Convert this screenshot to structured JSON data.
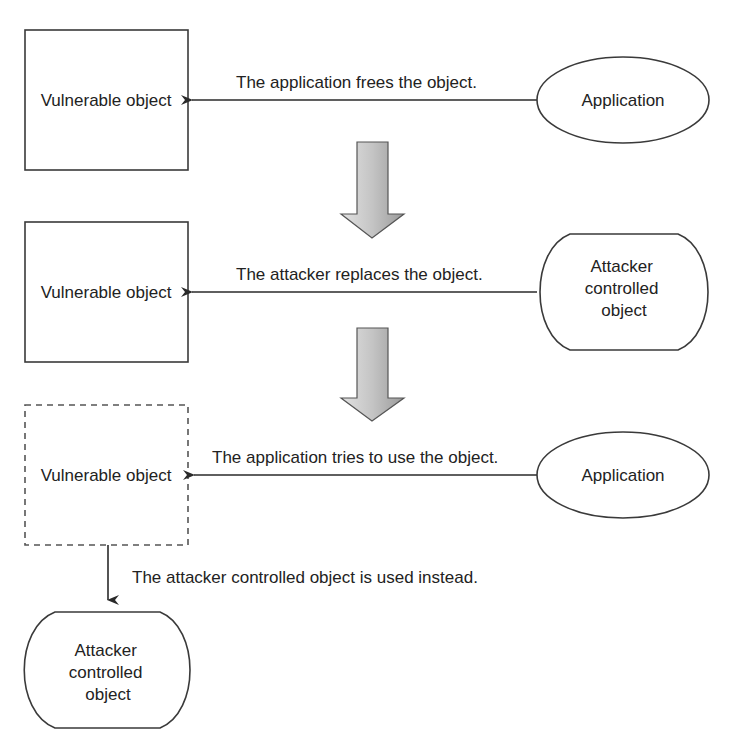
{
  "diagram": {
    "type": "flow",
    "title": "",
    "steps": [
      {
        "left_node": {
          "label": "Vulnerable object",
          "shape": "rectangle",
          "border": "solid"
        },
        "right_node": {
          "label": "Application",
          "shape": "ellipse"
        },
        "edge_label": "The application frees the object.",
        "edge_direction": "right-to-left"
      },
      {
        "left_node": {
          "label": "Vulnerable object",
          "shape": "rectangle",
          "border": "solid"
        },
        "right_node": {
          "label_lines": [
            "Attacker",
            "controlled",
            "object"
          ],
          "shape": "rounded-stadium"
        },
        "edge_label": "The attacker replaces the object.",
        "edge_direction": "right-to-left"
      },
      {
        "left_node": {
          "label": "Vulnerable object",
          "shape": "rectangle",
          "border": "dashed"
        },
        "right_node": {
          "label": "Application",
          "shape": "ellipse"
        },
        "edge_label": "The application tries to use the object.",
        "edge_direction": "right-to-left"
      }
    ],
    "final": {
      "edge_label": "The attacker controlled object is used instead.",
      "node": {
        "label_lines": [
          "Attacker",
          "controlled",
          "object"
        ],
        "shape": "rounded-stadium"
      }
    },
    "transition_arrows": [
      "step1-to-step2",
      "step2-to-step3"
    ],
    "colors": {
      "stroke": "#3a3a3a",
      "text": "#222222",
      "arrow_fill_light": "#d8d8d8",
      "arrow_fill_dark": "#9a9a9a"
    }
  }
}
